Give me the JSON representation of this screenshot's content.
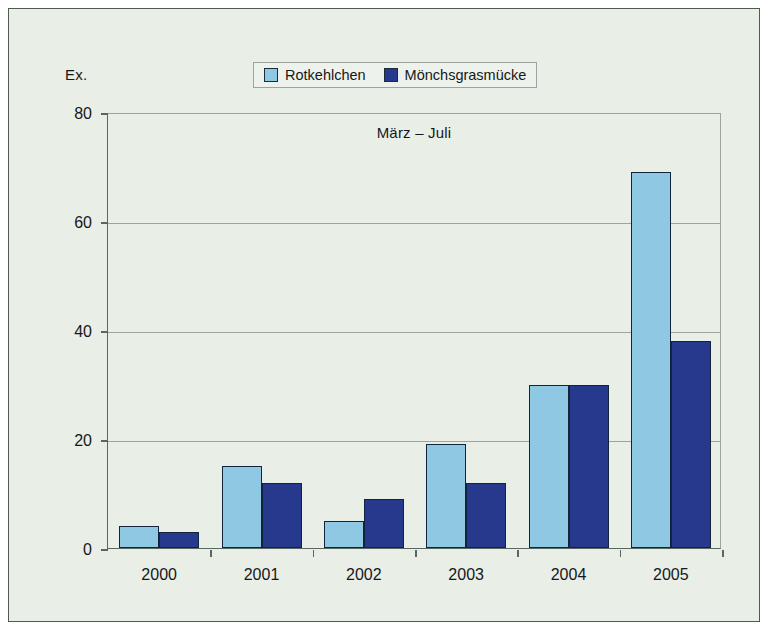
{
  "figure": {
    "background_color": "#e9eee7",
    "border_color": "#4e5b52"
  },
  "axis": {
    "y_unit_label": "Ex.",
    "y_ticks": [
      "0",
      "20",
      "40",
      "60",
      "80"
    ],
    "x_ticks": [
      "2000",
      "2001",
      "2002",
      "2003",
      "2004",
      "2005"
    ]
  },
  "legend": {
    "items": [
      {
        "label": "Rotkehlchen",
        "color": "#8ec8e2"
      },
      {
        "label": "Mönchsgrasmücke",
        "color": "#26398c"
      }
    ]
  },
  "chart_data": {
    "type": "bar",
    "title": "März – Juli",
    "xlabel": "",
    "ylabel": "Ex.",
    "ylim": [
      0,
      80
    ],
    "yticks": [
      0,
      20,
      40,
      60,
      80
    ],
    "grid": true,
    "legend_position": "top-center",
    "categories": [
      "2000",
      "2001",
      "2002",
      "2003",
      "2004",
      "2005"
    ],
    "series": [
      {
        "name": "Rotkehlchen",
        "color": "#8ec8e2",
        "values": [
          4,
          15,
          5,
          19,
          30,
          69
        ]
      },
      {
        "name": "Mönchsgrasmücke",
        "color": "#26398c",
        "values": [
          3,
          12,
          9,
          12,
          30,
          38
        ]
      }
    ]
  }
}
